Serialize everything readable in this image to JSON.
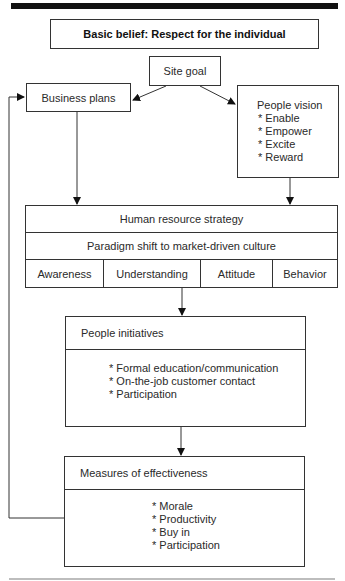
{
  "diagram": {
    "title": "Basic belief: Respect for the individual",
    "nodes": {
      "site_goal": "Site goal",
      "business_plans": "Business plans",
      "people_vision": {
        "heading": "People vision",
        "items": [
          "* Enable",
          "* Empower",
          "* Excite",
          "* Reward"
        ]
      },
      "hr_strategy": {
        "heading": "Human resource strategy",
        "subheading": "Paradigm shift to market-driven culture",
        "stages": [
          "Awareness",
          "Understanding",
          "Attitude",
          "Behavior"
        ]
      },
      "people_initiatives": {
        "heading": "People initiatives",
        "items": [
          "* Formal education/communication",
          "* On-the-job customer contact",
          "* Participation"
        ]
      },
      "measures": {
        "heading": "Measures of effectiveness",
        "items": [
          "* Morale",
          "* Productivity",
          "* Buy in",
          "* Participation"
        ]
      }
    },
    "edges": [
      {
        "from": "Site goal",
        "to": "Business plans"
      },
      {
        "from": "Site goal",
        "to": "People vision"
      },
      {
        "from": "Business plans",
        "to": "Human resource strategy"
      },
      {
        "from": "People vision",
        "to": "Human resource strategy"
      },
      {
        "from": "Human resource strategy",
        "to": "People initiatives"
      },
      {
        "from": "People initiatives",
        "to": "Measures of effectiveness"
      },
      {
        "from": "Measures of effectiveness",
        "to": "Business plans",
        "type": "feedback"
      }
    ],
    "colors": {
      "line": "#333333",
      "top_bar": "#111111",
      "bottom_rule": "#bdbdbd"
    }
  }
}
